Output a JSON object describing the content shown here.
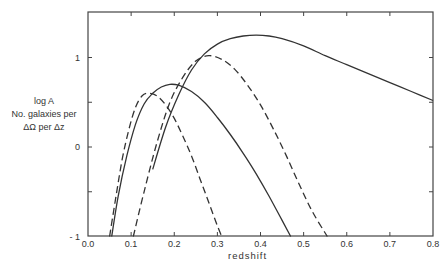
{
  "chart_data": {
    "type": "line",
    "title": "",
    "xlabel": "redshift",
    "ylabel_lines": [
      "log A",
      "No. galaxies per",
      "ΔΩ per Δz"
    ],
    "xlim": [
      0.0,
      0.8
    ],
    "ylim": [
      -1,
      1.4
    ],
    "x_ticks": [
      "0.0",
      "0.1",
      "0.2",
      "0.3",
      "0.4",
      "0.5",
      "0.6",
      "0.7",
      "0.8"
    ],
    "y_ticks": [
      "- 1",
      "0",
      "1"
    ],
    "grid": false,
    "legend": "none",
    "series": [
      {
        "name": "solid curve 1",
        "style": "solid",
        "x": [
          0.055,
          0.07,
          0.09,
          0.11,
          0.13,
          0.15,
          0.17,
          0.19,
          0.21,
          0.24,
          0.27,
          0.3,
          0.33,
          0.36,
          0.39,
          0.42,
          0.45,
          0.47
        ],
        "y": [
          -1.0,
          -0.55,
          -0.1,
          0.25,
          0.48,
          0.6,
          0.67,
          0.7,
          0.69,
          0.62,
          0.5,
          0.33,
          0.14,
          -0.07,
          -0.3,
          -0.55,
          -0.82,
          -1.0
        ]
      },
      {
        "name": "dashed curve 1",
        "style": "dashed",
        "x": [
          0.05,
          0.065,
          0.08,
          0.095,
          0.11,
          0.125,
          0.14,
          0.16,
          0.18,
          0.2,
          0.22,
          0.24,
          0.26,
          0.28,
          0.3,
          0.31
        ],
        "y": [
          -1.0,
          -0.55,
          -0.12,
          0.2,
          0.44,
          0.57,
          0.6,
          0.57,
          0.47,
          0.32,
          0.12,
          -0.1,
          -0.36,
          -0.62,
          -0.88,
          -1.0
        ]
      },
      {
        "name": "dashed curve 2",
        "style": "dashed",
        "x": [
          0.105,
          0.13,
          0.16,
          0.19,
          0.22,
          0.25,
          0.28,
          0.31,
          0.34,
          0.37,
          0.4,
          0.43,
          0.46,
          0.49,
          0.52,
          0.555
        ],
        "y": [
          -1.0,
          -0.5,
          0.05,
          0.5,
          0.78,
          0.96,
          1.02,
          0.98,
          0.87,
          0.69,
          0.47,
          0.2,
          -0.1,
          -0.42,
          -0.72,
          -1.0
        ]
      },
      {
        "name": "solid curve 2",
        "style": "solid",
        "x": [
          0.15,
          0.18,
          0.21,
          0.24,
          0.27,
          0.3,
          0.33,
          0.36,
          0.39,
          0.42,
          0.45,
          0.5,
          0.55,
          0.6,
          0.65,
          0.7,
          0.75,
          0.8
        ],
        "y": [
          -0.25,
          0.22,
          0.58,
          0.86,
          1.04,
          1.15,
          1.21,
          1.24,
          1.25,
          1.24,
          1.21,
          1.13,
          1.02,
          0.92,
          0.82,
          0.72,
          0.62,
          0.52
        ]
      }
    ]
  }
}
